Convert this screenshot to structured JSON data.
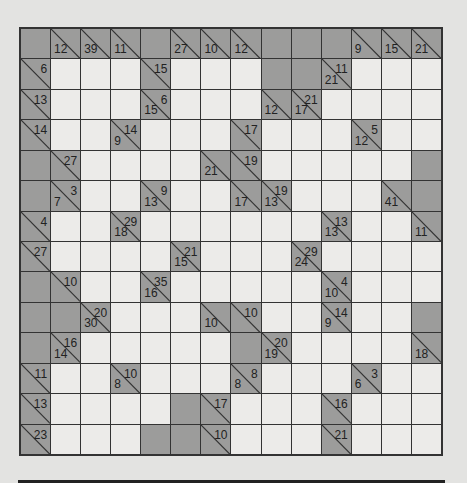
{
  "puzzle": {
    "type": "kakuro",
    "rows": 14,
    "cols": 14,
    "legend": {
      "B": "block",
      "W": "empty white cell",
      "clue": "{a: across sum, d: down sum}"
    },
    "grid": [
      [
        {
          "t": "B"
        },
        {
          "t": "C",
          "d": 12
        },
        {
          "t": "C",
          "d": 39
        },
        {
          "t": "C",
          "d": 11
        },
        {
          "t": "B"
        },
        {
          "t": "C",
          "d": 27
        },
        {
          "t": "C",
          "d": 10
        },
        {
          "t": "C",
          "d": 12
        },
        {
          "t": "B"
        },
        {
          "t": "B"
        },
        {
          "t": "B"
        },
        {
          "t": "C",
          "d": 9
        },
        {
          "t": "C",
          "d": 15
        },
        {
          "t": "C",
          "d": 21
        }
      ],
      [
        {
          "t": "C",
          "a": 6
        },
        {
          "t": "W"
        },
        {
          "t": "W"
        },
        {
          "t": "W"
        },
        {
          "t": "C",
          "a": 15
        },
        {
          "t": "W"
        },
        {
          "t": "W"
        },
        {
          "t": "W"
        },
        {
          "t": "B"
        },
        {
          "t": "B"
        },
        {
          "t": "C",
          "a": 11,
          "d": 21
        },
        {
          "t": "W"
        },
        {
          "t": "W"
        },
        {
          "t": "W"
        }
      ],
      [
        {
          "t": "C",
          "a": 13
        },
        {
          "t": "W"
        },
        {
          "t": "W"
        },
        {
          "t": "W"
        },
        {
          "t": "C",
          "a": 6,
          "d": 15
        },
        {
          "t": "W"
        },
        {
          "t": "W"
        },
        {
          "t": "W"
        },
        {
          "t": "C",
          "d": 12
        },
        {
          "t": "C",
          "a": 21,
          "d": 17
        },
        {
          "t": "W"
        },
        {
          "t": "W"
        },
        {
          "t": "W"
        },
        {
          "t": "W"
        }
      ],
      [
        {
          "t": "C",
          "a": 14
        },
        {
          "t": "W"
        },
        {
          "t": "W"
        },
        {
          "t": "C",
          "a": 14,
          "d": 9
        },
        {
          "t": "W"
        },
        {
          "t": "W"
        },
        {
          "t": "W"
        },
        {
          "t": "C",
          "a": 17
        },
        {
          "t": "W"
        },
        {
          "t": "W"
        },
        {
          "t": "W"
        },
        {
          "t": "C",
          "a": 5,
          "d": 12
        },
        {
          "t": "W"
        },
        {
          "t": "W"
        }
      ],
      [
        {
          "t": "B"
        },
        {
          "t": "C",
          "a": 27
        },
        {
          "t": "W"
        },
        {
          "t": "W"
        },
        {
          "t": "W"
        },
        {
          "t": "W"
        },
        {
          "t": "C",
          "d": 21
        },
        {
          "t": "C",
          "a": 19
        },
        {
          "t": "W"
        },
        {
          "t": "W"
        },
        {
          "t": "W"
        },
        {
          "t": "W"
        },
        {
          "t": "W"
        },
        {
          "t": "B"
        }
      ],
      [
        {
          "t": "B"
        },
        {
          "t": "C",
          "a": 3,
          "d": 7
        },
        {
          "t": "W"
        },
        {
          "t": "W"
        },
        {
          "t": "C",
          "a": 9,
          "d": 13
        },
        {
          "t": "W"
        },
        {
          "t": "W"
        },
        {
          "t": "C",
          "d": 17
        },
        {
          "t": "C",
          "a": 19,
          "d": 13
        },
        {
          "t": "W"
        },
        {
          "t": "W"
        },
        {
          "t": "W"
        },
        {
          "t": "C",
          "d": 41
        },
        {
          "t": "B"
        }
      ],
      [
        {
          "t": "C",
          "a": 4
        },
        {
          "t": "W"
        },
        {
          "t": "W"
        },
        {
          "t": "C",
          "a": 29,
          "d": 18
        },
        {
          "t": "W"
        },
        {
          "t": "W"
        },
        {
          "t": "W"
        },
        {
          "t": "W"
        },
        {
          "t": "W"
        },
        {
          "t": "W"
        },
        {
          "t": "C",
          "a": 13,
          "d": 13
        },
        {
          "t": "W"
        },
        {
          "t": "W"
        },
        {
          "t": "C",
          "d": 11
        }
      ],
      [
        {
          "t": "C",
          "a": 27
        },
        {
          "t": "W"
        },
        {
          "t": "W"
        },
        {
          "t": "W"
        },
        {
          "t": "W"
        },
        {
          "t": "C",
          "a": 21,
          "d": 15
        },
        {
          "t": "W"
        },
        {
          "t": "W"
        },
        {
          "t": "W"
        },
        {
          "t": "C",
          "a": 29,
          "d": 24
        },
        {
          "t": "W"
        },
        {
          "t": "W"
        },
        {
          "t": "W"
        },
        {
          "t": "W"
        }
      ],
      [
        {
          "t": "B"
        },
        {
          "t": "C",
          "a": 10
        },
        {
          "t": "W"
        },
        {
          "t": "W"
        },
        {
          "t": "C",
          "a": 35,
          "d": 16
        },
        {
          "t": "W"
        },
        {
          "t": "W"
        },
        {
          "t": "W"
        },
        {
          "t": "W"
        },
        {
          "t": "W"
        },
        {
          "t": "C",
          "a": 4,
          "d": 10
        },
        {
          "t": "W"
        },
        {
          "t": "W"
        },
        {
          "t": "W"
        }
      ],
      [
        {
          "t": "B"
        },
        {
          "t": "B"
        },
        {
          "t": "C",
          "a": 20,
          "d": 30
        },
        {
          "t": "W"
        },
        {
          "t": "W"
        },
        {
          "t": "W"
        },
        {
          "t": "C",
          "d": 10
        },
        {
          "t": "C",
          "a": 10
        },
        {
          "t": "W"
        },
        {
          "t": "W"
        },
        {
          "t": "C",
          "a": 14,
          "d": 9
        },
        {
          "t": "W"
        },
        {
          "t": "W"
        },
        {
          "t": "B"
        }
      ],
      [
        {
          "t": "B"
        },
        {
          "t": "C",
          "a": 16,
          "d": 14
        },
        {
          "t": "W"
        },
        {
          "t": "W"
        },
        {
          "t": "W"
        },
        {
          "t": "W"
        },
        {
          "t": "W"
        },
        {
          "t": "B"
        },
        {
          "t": "C",
          "a": 20,
          "d": 19
        },
        {
          "t": "W"
        },
        {
          "t": "W"
        },
        {
          "t": "W"
        },
        {
          "t": "W"
        },
        {
          "t": "C",
          "d": 18
        }
      ],
      [
        {
          "t": "C",
          "a": 11
        },
        {
          "t": "W"
        },
        {
          "t": "W"
        },
        {
          "t": "C",
          "a": 10,
          "d": 8
        },
        {
          "t": "W"
        },
        {
          "t": "W"
        },
        {
          "t": "W"
        },
        {
          "t": "C",
          "a": 8,
          "d": 8
        },
        {
          "t": "W"
        },
        {
          "t": "W"
        },
        {
          "t": "W"
        },
        {
          "t": "C",
          "a": 3,
          "d": 6
        },
        {
          "t": "W"
        },
        {
          "t": "W"
        }
      ],
      [
        {
          "t": "C",
          "a": 13
        },
        {
          "t": "W"
        },
        {
          "t": "W"
        },
        {
          "t": "W"
        },
        {
          "t": "W"
        },
        {
          "t": "B"
        },
        {
          "t": "C",
          "a": 17
        },
        {
          "t": "W"
        },
        {
          "t": "W"
        },
        {
          "t": "W"
        },
        {
          "t": "C",
          "a": 16
        },
        {
          "t": "W"
        },
        {
          "t": "W"
        },
        {
          "t": "W"
        }
      ],
      [
        {
          "t": "C",
          "a": 23
        },
        {
          "t": "W"
        },
        {
          "t": "W"
        },
        {
          "t": "W"
        },
        {
          "t": "B"
        },
        {
          "t": "B"
        },
        {
          "t": "C",
          "a": 10
        },
        {
          "t": "W"
        },
        {
          "t": "W"
        },
        {
          "t": "W"
        },
        {
          "t": "C",
          "a": 21
        },
        {
          "t": "W"
        },
        {
          "t": "W"
        },
        {
          "t": "W"
        }
      ]
    ]
  },
  "colors": {
    "background": "#e3e3e1",
    "white_cell": "#ecebe9",
    "block_cell": "#9c9c9b",
    "grid_line": "#333333",
    "text": "#222222"
  }
}
